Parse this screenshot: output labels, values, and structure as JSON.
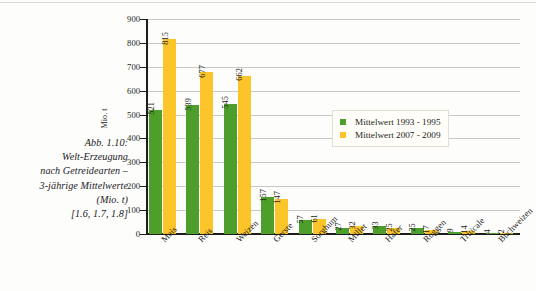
{
  "figure": {
    "caption_lines": [
      "Abb. 1.10:",
      "Welt-Erzeugung",
      "nach Getreidearten –",
      "3-jährige Mittelwerte",
      "(Mio. t)",
      "[1.6, 1.7, 1.8]"
    ]
  },
  "colors": {
    "series_1993_1995": "#4e9e2b",
    "series_2007_2009": "#fbc428",
    "axis": "#1d1d1b",
    "gridline": "#c9c9c6",
    "legend_background": "#fffef9",
    "legend_border": "#e2ded2",
    "text": "#1d1d1b",
    "page_background": "#fdfdfc"
  },
  "chart_data": {
    "type": "bar",
    "title": "",
    "xlabel": "",
    "ylabel": "Mio. t",
    "ylim": [
      0,
      900
    ],
    "yticks": [
      0,
      100,
      200,
      300,
      400,
      500,
      600,
      700,
      800,
      900
    ],
    "ytick_labels": [
      "0",
      "100",
      "200",
      "300",
      "400",
      "500",
      "600",
      "700",
      "800",
      "900"
    ],
    "grid": true,
    "legend_position": "upper-right-inside",
    "categories": [
      "Mais",
      "Reis",
      "Weizen",
      "Gerste",
      "Sorghum",
      "Millet",
      "Hafer",
      "Roggen",
      "Triticale",
      "Buchweizen"
    ],
    "series": [
      {
        "name": "Mittelwert 1993 - 1995",
        "color": "#4e9e2b",
        "values": [
          521,
          539,
          545,
          157,
          57,
          27,
          33,
          25,
          9,
          4
        ]
      },
      {
        "name": "Mittelwert 2007 - 2009",
        "color": "#fbc428",
        "values": [
          815,
          677,
          662,
          147,
          61,
          32,
          25,
          17,
          14,
          2
        ]
      }
    ]
  },
  "legend": {
    "entries": [
      {
        "label": "Mittelwert 1993 - 1995"
      },
      {
        "label": "Mittelwert 2007 - 2009"
      }
    ]
  }
}
